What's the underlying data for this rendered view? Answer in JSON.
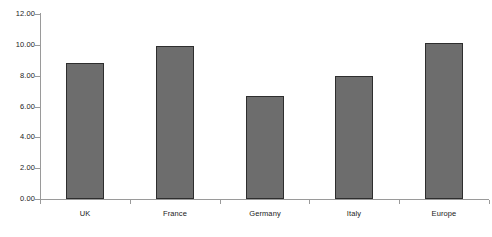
{
  "chart_data": {
    "type": "bar",
    "title": "",
    "subtitle": "",
    "xlabel": "",
    "ylabel": "",
    "categories": [
      "UK",
      "France",
      "Germany",
      "Italy",
      "Europe"
    ],
    "values": [
      8.8,
      9.9,
      6.7,
      8.0,
      10.1
    ],
    "ylim": [
      0,
      12
    ],
    "ytick_step": 2,
    "ytick_labels": [
      "12.00",
      "10.00",
      "8.00",
      "6.00",
      "4.00",
      "2.00",
      "0.00"
    ],
    "ytick_values": [
      12,
      10,
      8,
      6,
      4,
      2,
      0
    ],
    "grid": false,
    "legend": false,
    "legend_position": "none",
    "bar_fill_color": "#6d6d6d",
    "bar_border_color": "#2e2e2e",
    "axis_color": "#9a9a9a",
    "text_color": "#1a1a1a",
    "background_color": "#ffffff"
  }
}
